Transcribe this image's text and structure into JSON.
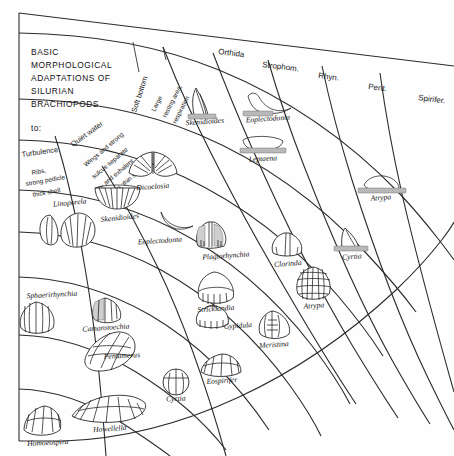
{
  "diagram": {
    "title_lines": [
      "BASIC",
      "MORPHOLOGICAL",
      "ADAPTATIONS OF",
      "SILURIAN",
      "BRACHIOPODS"
    ],
    "to_label": "to:",
    "background": "#fefefe",
    "line_color": "#2b2b2b"
  },
  "orders": [
    {
      "id": "orthida",
      "label": "Orthida"
    },
    {
      "id": "strophomenida",
      "label": "Strophom."
    },
    {
      "id": "rhynchonellida",
      "label": "Rhyn."
    },
    {
      "id": "pentamerida",
      "label": "Pent."
    },
    {
      "id": "spiriferida",
      "label": "Spirifer."
    }
  ],
  "bands": [
    {
      "id": "turbulence",
      "label": "Turbulence",
      "detail_lines": [
        "Ribs,",
        "strong pedicle",
        "thick shell"
      ]
    },
    {
      "id": "quiet-water",
      "label": "Quiet water",
      "detail_lines": [
        "Wings and strong",
        "sulcus separate",
        "in- and exhalent",
        "currents, thin shell"
      ]
    },
    {
      "id": "soft-bottom",
      "label": "Soft bottom",
      "detail_lines": [
        "Large",
        "resting area,",
        "respiration"
      ]
    }
  ],
  "genera": [
    {
      "id": "skenidioides-top",
      "label": "Skenidioides",
      "x": 205,
      "y": 124,
      "anchor": "middle"
    },
    {
      "id": "eoplectodonta-top",
      "label": "Eoplectodonta",
      "x": 268,
      "y": 121,
      "anchor": "middle"
    },
    {
      "id": "leptaena",
      "label": "Leptaena",
      "x": 263,
      "y": 158,
      "anchor": "middle"
    },
    {
      "id": "dicoelosia",
      "label": "Dicoelosia",
      "x": 153,
      "y": 180,
      "anchor": "middle"
    },
    {
      "id": "skenidioides-mid",
      "label": "Skenidioides",
      "x": 117,
      "y": 214,
      "anchor": "middle"
    },
    {
      "id": "linoporela",
      "label": "Linoporela",
      "x": 70,
      "y": 203,
      "anchor": "middle"
    },
    {
      "id": "eoplectodonta-mid",
      "label": "Eoplectodonta",
      "x": 158,
      "y": 242,
      "anchor": "middle"
    },
    {
      "id": "plagiorhynchia",
      "label": "Plagiorhynchia",
      "x": 225,
      "y": 253,
      "anchor": "middle"
    },
    {
      "id": "clorinda",
      "label": "Clorinda",
      "x": 287,
      "y": 263,
      "anchor": "middle"
    },
    {
      "id": "atrypa-top",
      "label": "Atrypa",
      "x": 381,
      "y": 197,
      "anchor": "middle"
    },
    {
      "id": "cyrtia-right",
      "label": "Cyrtia",
      "x": 353,
      "y": 257,
      "anchor": "middle"
    },
    {
      "id": "atrypa-mid",
      "label": "Atrypa",
      "x": 314,
      "y": 304,
      "anchor": "middle"
    },
    {
      "id": "sphaerirhynchia",
      "label": "Sphaerirhynchia",
      "x": 47,
      "y": 297,
      "anchor": "middle"
    },
    {
      "id": "camarotoechia",
      "label": "Camarotoechia",
      "x": 106,
      "y": 324,
      "anchor": "middle"
    },
    {
      "id": "stricklandia",
      "label": "Stricklandia",
      "x": 215,
      "y": 309,
      "anchor": "middle"
    },
    {
      "id": "gypidula",
      "label": "Gypidula",
      "x": 214,
      "y": 331,
      "anchor": "middle"
    },
    {
      "id": "meristina",
      "label": "Meristina",
      "x": 274,
      "y": 341,
      "anchor": "middle"
    },
    {
      "id": "pentamerus",
      "label": "Pentamerus",
      "x": 118,
      "y": 358,
      "anchor": "middle"
    },
    {
      "id": "eospirifer",
      "label": "Eospirifer",
      "x": 222,
      "y": 381,
      "anchor": "middle"
    },
    {
      "id": "cyrtia-bottom",
      "label": "Cyrtia",
      "x": 176,
      "y": 400,
      "anchor": "middle"
    },
    {
      "id": "howellella",
      "label": "Howellella",
      "x": 110,
      "y": 422,
      "anchor": "middle"
    },
    {
      "id": "homoeospira",
      "label": "Homoeospira",
      "x": 48,
      "y": 439,
      "anchor": "middle"
    }
  ]
}
